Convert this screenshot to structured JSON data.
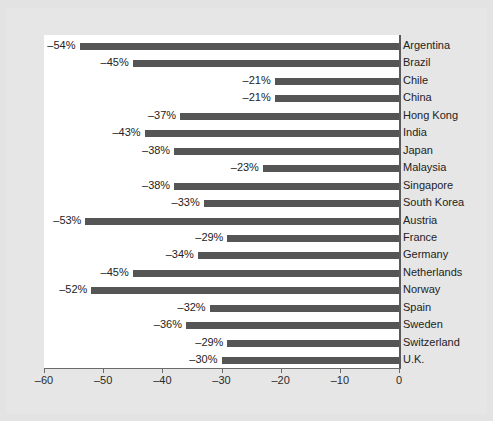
{
  "figure": {
    "background_color": "#e3e3e3",
    "plot_background_color": "#ffffff",
    "bar_color": "#555555",
    "axis_color": "#5a5a5a",
    "text_color": "#232323"
  },
  "chart_data": {
    "type": "bar",
    "orientation": "horizontal",
    "title": "",
    "subtitle": "",
    "xlabel": "",
    "ylabel": "",
    "xlim": [
      -60,
      0
    ],
    "ylim": null,
    "grid": false,
    "legend": null,
    "xticks": [
      -60,
      -50,
      -40,
      -30,
      -20,
      -10,
      0
    ],
    "xtick_labels": [
      "–60",
      "–50",
      "–40",
      "–30",
      "–20",
      "–10",
      "0"
    ],
    "categories": [
      "Argentina",
      "Brazil",
      "Chile",
      "China",
      "Hong Kong",
      "India",
      "Japan",
      "Malaysia",
      "Singapore",
      "South Korea",
      "Austria",
      "France",
      "Germany",
      "Netherlands",
      "Norway",
      "Spain",
      "Sweden",
      "Switzerland",
      "U.K."
    ],
    "values": [
      -54,
      -45,
      -21,
      -21,
      -37,
      -43,
      -38,
      -23,
      -38,
      -33,
      -53,
      -29,
      -34,
      -45,
      -52,
      -32,
      -36,
      -29,
      -30
    ],
    "value_labels": [
      "–54%",
      "–45%",
      "–21%",
      "–21%",
      "–37%",
      "–43%",
      "–38%",
      "–23%",
      "–38%",
      "–33%",
      "–53%",
      "–29%",
      "–34%",
      "–45%",
      "–52%",
      "–32%",
      "–36%",
      "–29%",
      "–30%"
    ]
  }
}
